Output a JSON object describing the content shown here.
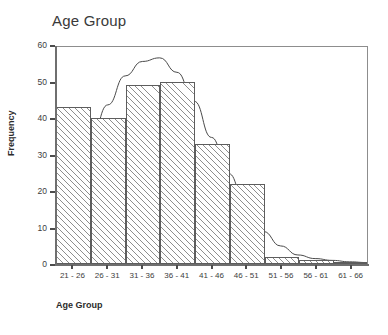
{
  "chart_data": {
    "type": "bar",
    "title": "Age Group",
    "xlabel": "Age Group",
    "ylabel": "Frequency",
    "categories": [
      "21 - 26",
      "26 - 31",
      "31 - 36",
      "36 - 41",
      "41 - 46",
      "46 - 51",
      "51 - 56",
      "56 - 61",
      "61 - 66"
    ],
    "values": [
      43,
      40,
      49,
      50,
      33,
      22,
      2,
      1,
      0.5
    ],
    "ylim": [
      0,
      60
    ],
    "yticks": [
      0,
      10,
      20,
      30,
      40,
      50,
      60
    ],
    "ytick_labels": [
      "0",
      "10",
      "20",
      "30",
      "40",
      "50",
      "60"
    ],
    "grid": false,
    "legend": "none",
    "overlay": {
      "name": "normal-curve",
      "type": "line",
      "description": "normal distribution curve",
      "peak_value": 57,
      "peak_category": "31 - 36 / 36 - 41 boundary",
      "points": [
        {
          "x": 0.0,
          "y": 16
        },
        {
          "x": 0.5,
          "y": 21
        },
        {
          "x": 1.0,
          "y": 34
        },
        {
          "x": 1.5,
          "y": 44
        },
        {
          "x": 2.0,
          "y": 52
        },
        {
          "x": 2.5,
          "y": 56
        },
        {
          "x": 3.0,
          "y": 57
        },
        {
          "x": 3.5,
          "y": 53
        },
        {
          "x": 4.0,
          "y": 45
        },
        {
          "x": 4.5,
          "y": 35
        },
        {
          "x": 5.0,
          "y": 25
        },
        {
          "x": 5.5,
          "y": 16
        },
        {
          "x": 6.0,
          "y": 9
        },
        {
          "x": 6.5,
          "y": 5
        },
        {
          "x": 7.0,
          "y": 2.5
        },
        {
          "x": 7.5,
          "y": 1.5
        },
        {
          "x": 8.0,
          "y": 1
        },
        {
          "x": 8.5,
          "y": 0.6
        },
        {
          "x": 9.0,
          "y": 0.4
        }
      ]
    }
  },
  "colors": {
    "bar_edge": "#5d5d5d",
    "bar_hatch": "#8e8e8e",
    "axis": "#6f6f6f",
    "frame": "#8d8d8d",
    "curve": "#4a4a4a",
    "text": "#2b2b2b",
    "background": "#ffffff"
  }
}
